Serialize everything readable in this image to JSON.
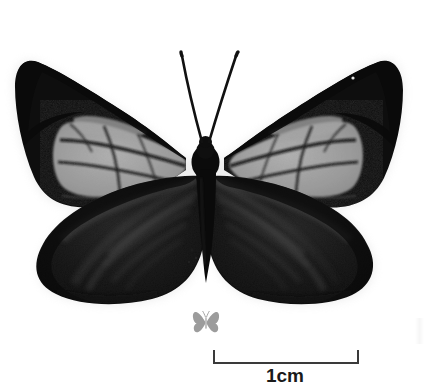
{
  "figure": {
    "caption_visible": false,
    "background_color": "#ffffff",
    "scale": {
      "label": "1cm",
      "bar_length_px": 144,
      "bar_color": "#3a3a3a",
      "tick_height_px": 14,
      "position": "bottom-center"
    },
    "watermark": {
      "name": "butterfly-silhouette-watermark",
      "color": "#9a9a9a",
      "position": "below-specimen"
    },
    "specimen": {
      "view": "dorsal",
      "mount": "spread-wings-pinned",
      "palette": {
        "wing_black": "#080808",
        "wing_dark": "#141414",
        "hindwing_streak": "#4c4c4c",
        "forewing_patch_grey": "#9d9d9d",
        "forewing_patch_grey_light": "#b4b4b4",
        "vein_dark": "#101010",
        "body_black": "#050505",
        "halo_white": "#ffffff"
      },
      "features": [
        "black forewings with large pale-grey median patches",
        "dark veins crossing the pale patches",
        "near-black hindwings with radiating grey streaks",
        "slender tapering abdomen",
        "two long antennae forming a narrow V",
        "small white speck on right forewing"
      ]
    }
  }
}
